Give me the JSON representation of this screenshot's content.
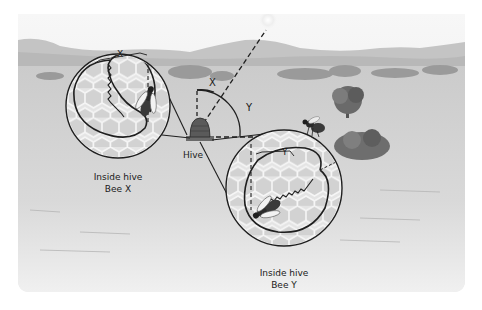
{
  "figure": {
    "labels": {
      "hive": "Hive",
      "angle_x": "X",
      "angle_y": "Y",
      "circle_x_angle": "X",
      "circle_y_angle": "Y",
      "inset_x_line1": "Inside hive",
      "inset_x_line2": "Bee X",
      "inset_y_line1": "Inside hive",
      "inset_y_line2": "Bee Y"
    },
    "colors": {
      "sky": "#f4f4f4",
      "hills": "#bdbdbd",
      "field": "#d6d6d6",
      "ink": "#1f1f1f",
      "comb": "#e2e2e2",
      "comb_cell": "#cfcfcf"
    }
  }
}
